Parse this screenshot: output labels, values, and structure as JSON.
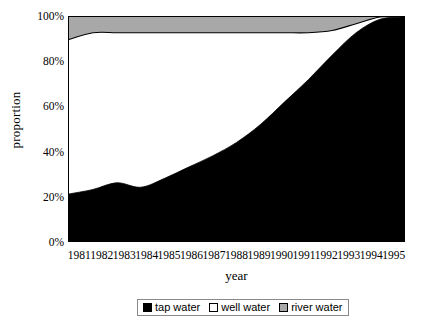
{
  "chart_data": {
    "type": "area",
    "stacked": true,
    "title": "",
    "xlabel": "year",
    "ylabel": "proportion",
    "categories": [
      "1981",
      "1982",
      "1983",
      "1984",
      "1985",
      "1986",
      "1987",
      "1988",
      "1989",
      "1990",
      "1991",
      "1992",
      "1993",
      "1994",
      "1995"
    ],
    "x": [
      1981,
      1982,
      1983,
      1984,
      1985,
      1986,
      1987,
      1988,
      1989,
      1990,
      1991,
      1992,
      1993,
      1994,
      1995
    ],
    "ylim": [
      0,
      100
    ],
    "yticks": [
      0,
      20,
      40,
      60,
      80,
      100
    ],
    "ytick_labels": [
      "0%",
      "20%",
      "40%",
      "60%",
      "80%",
      "100%"
    ],
    "grid": false,
    "legend_position": "bottom",
    "series": [
      {
        "name": "tap water",
        "color": "#000000",
        "values": [
          21,
          23,
          26,
          24,
          28,
          33,
          38,
          44,
          52,
          62,
          72,
          83,
          93,
          99,
          100
        ]
      },
      {
        "name": "well water",
        "color": "#ffffff",
        "values": [
          69,
          70,
          67,
          69,
          65,
          60,
          55,
          49,
          41,
          31,
          21,
          11,
          4,
          1,
          0
        ]
      },
      {
        "name": "river water",
        "color": "#a8a8a8",
        "values": [
          10,
          7,
          7,
          7,
          7,
          7,
          7,
          7,
          7,
          7,
          7,
          6,
          3,
          0,
          0
        ]
      }
    ]
  },
  "axes": {
    "y_title": "proportion",
    "x_title": "year",
    "y_tick_labels": [
      "100%",
      "80%",
      "60%",
      "40%",
      "20%",
      "0%"
    ],
    "x_tick_labels": [
      "1981",
      "1982",
      "1983",
      "1984",
      "1985",
      "1986",
      "1987",
      "1988",
      "1989",
      "1990",
      "1991",
      "1992",
      "1993",
      "1994",
      "1995"
    ]
  },
  "legend": {
    "items": [
      {
        "label": "tap water",
        "color": "#000000"
      },
      {
        "label": "well water",
        "color": "#ffffff"
      },
      {
        "label": "river water",
        "color": "#a8a8a8"
      }
    ]
  },
  "colors": {
    "tap_water": "#000000",
    "well_water": "#ffffff",
    "river_water": "#a8a8a8",
    "axis": "#000000",
    "background": "#ffffff"
  }
}
